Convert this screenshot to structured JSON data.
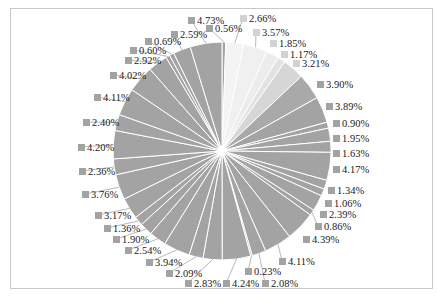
{
  "chart_data": {
    "type": "pie",
    "title": "",
    "start_angle_deg": 0,
    "direction": "clockwise",
    "unit": "%",
    "colors": {
      "default": "#a3a3a3",
      "slice_border": "#ffffff",
      "label_text": "#222222",
      "frame_border": "#c8c8c8"
    },
    "slices": [
      {
        "value": 0.56,
        "label": "0.56%",
        "color": "#a3a3a3",
        "lx": 206,
        "ly": 23
      },
      {
        "value": 2.66,
        "label": "2.66%",
        "color": "#f4f4f4",
        "lx": 240,
        "ly": 13
      },
      {
        "value": 3.57,
        "label": "3.57%",
        "color": "#f0f0f0",
        "lx": 253,
        "ly": 27
      },
      {
        "value": 1.85,
        "label": "1.85%",
        "color": "#ececec",
        "lx": 270,
        "ly": 38
      },
      {
        "value": 1.17,
        "label": "1.17%",
        "color": "#e2e2e2",
        "lx": 281,
        "ly": 49
      },
      {
        "value": 3.21,
        "label": "3.21%",
        "color": "#d6d6d6",
        "lx": 293,
        "ly": 58
      },
      {
        "value": 3.9,
        "label": "3.90%",
        "color": "#a9a9a9",
        "lx": 317,
        "ly": 79
      },
      {
        "value": 3.89,
        "label": "3.89%",
        "color": "#a3a3a3",
        "lx": 326,
        "ly": 101
      },
      {
        "value": 0.9,
        "label": "0.90%",
        "color": "#a3a3a3",
        "lx": 333,
        "ly": 118
      },
      {
        "value": 1.95,
        "label": "1.95%",
        "color": "#a3a3a3",
        "lx": 333,
        "ly": 133
      },
      {
        "value": 1.63,
        "label": "1.63%",
        "color": "#a3a3a3",
        "lx": 333,
        "ly": 148
      },
      {
        "value": 4.17,
        "label": "4.17%",
        "color": "#a3a3a3",
        "lx": 333,
        "ly": 164
      },
      {
        "value": 1.34,
        "label": "1.34%",
        "color": "#a3a3a3",
        "lx": 328,
        "ly": 185
      },
      {
        "value": 1.06,
        "label": "1.06%",
        "color": "#a3a3a3",
        "lx": 325,
        "ly": 198
      },
      {
        "value": 2.39,
        "label": "2.39%",
        "color": "#a3a3a3",
        "lx": 320,
        "ly": 209
      },
      {
        "value": 0.86,
        "label": "0.86%",
        "color": "#a3a3a3",
        "lx": 315,
        "ly": 221
      },
      {
        "value": 4.39,
        "label": "4.39%",
        "color": "#a3a3a3",
        "lx": 303,
        "ly": 234
      },
      {
        "value": 4.11,
        "label": "4.11%",
        "color": "#a3a3a3",
        "lx": 279,
        "ly": 256
      },
      {
        "value": 2.08,
        "label": "2.08%",
        "color": "#a3a3a3",
        "lx": 262,
        "ly": 278
      },
      {
        "value": 0.23,
        "label": "0.23%",
        "color": "#a3a3a3",
        "lx": 245,
        "ly": 266
      },
      {
        "value": 4.24,
        "label": "4.24%",
        "color": "#a3a3a3",
        "lx": 223,
        "ly": 278
      },
      {
        "value": 2.83,
        "label": "2.83%",
        "color": "#a3a3a3",
        "lx": 185,
        "ly": 278
      },
      {
        "value": 2.09,
        "label": "2.09%",
        "color": "#a3a3a3",
        "lx": 166,
        "ly": 268
      },
      {
        "value": 3.94,
        "label": "3.94%",
        "color": "#a3a3a3",
        "lx": 146,
        "ly": 257
      },
      {
        "value": 2.54,
        "label": "2.54%",
        "color": "#a3a3a3",
        "lx": 125,
        "ly": 245
      },
      {
        "value": 1.9,
        "label": "1.90%",
        "color": "#a3a3a3",
        "lx": 113,
        "ly": 234
      },
      {
        "value": 1.36,
        "label": "1.36%",
        "color": "#a3a3a3",
        "lx": 104,
        "ly": 223
      },
      {
        "value": 3.17,
        "label": "3.17%",
        "color": "#a3a3a3",
        "lx": 95,
        "ly": 210
      },
      {
        "value": 3.76,
        "label": "3.76%",
        "color": "#a3a3a3",
        "lx": 82,
        "ly": 189
      },
      {
        "value": 2.36,
        "label": "2.36%",
        "color": "#a3a3a3",
        "lx": 79,
        "ly": 166
      },
      {
        "value": 4.2,
        "label": "4.20%",
        "color": "#a3a3a3",
        "lx": 78,
        "ly": 142
      },
      {
        "value": 2.4,
        "label": "2.40%",
        "color": "#a3a3a3",
        "lx": 83,
        "ly": 117
      },
      {
        "value": 4.11,
        "label": "4.11%",
        "color": "#a3a3a3",
        "lx": 94,
        "ly": 92
      },
      {
        "value": 4.02,
        "label": "4.02%",
        "color": "#a3a3a3",
        "lx": 110,
        "ly": 70
      },
      {
        "value": 2.92,
        "label": "2.92%",
        "color": "#a3a3a3",
        "lx": 125,
        "ly": 55
      },
      {
        "value": 0.6,
        "label": "0.60%",
        "color": "#a3a3a3",
        "lx": 130,
        "ly": 45
      },
      {
        "value": 0.69,
        "label": "0.69%",
        "color": "#a3a3a3",
        "lx": 145,
        "ly": 36
      },
      {
        "value": 2.59,
        "label": "2.59%",
        "color": "#a3a3a3",
        "lx": 171,
        "ly": 29
      },
      {
        "value": 4.73,
        "label": "4.73%",
        "color": "#a3a3a3",
        "lx": 188,
        "ly": 15
      }
    ],
    "values": [
      0.56,
      2.66,
      3.57,
      1.85,
      1.17,
      3.21,
      3.9,
      3.89,
      0.9,
      1.95,
      1.63,
      4.17,
      1.34,
      1.06,
      2.39,
      0.86,
      4.39,
      4.11,
      2.08,
      0.23,
      4.24,
      2.83,
      2.09,
      3.94,
      2.54,
      1.9,
      1.36,
      3.17,
      3.76,
      2.36,
      4.2,
      2.4,
      4.11,
      4.02,
      2.92,
      0.6,
      0.69,
      2.59,
      4.73
    ],
    "legend": "none",
    "data_labels": "percent outside with color marker",
    "geometry": {
      "cx": 222,
      "cy": 151,
      "r": 109
    }
  }
}
